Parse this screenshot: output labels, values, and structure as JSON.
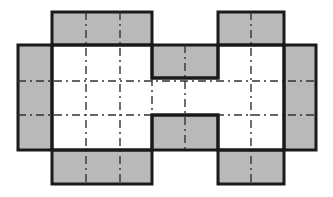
{
  "diagram": {
    "type": "box-net",
    "canvas": {
      "width": 333,
      "height": 197
    },
    "colors": {
      "fill": "#b9b9b9",
      "stroke": "#1a1a1a",
      "fold": "#333333",
      "background": "#ffffff"
    },
    "gray_panels": [
      {
        "name": "left-flap",
        "x": 18,
        "y": 45,
        "w": 34,
        "h": 105
      },
      {
        "name": "top-left-tab",
        "x": 52,
        "y": 12,
        "w": 100,
        "h": 33
      },
      {
        "name": "bottom-left-tab",
        "x": 52,
        "y": 150,
        "w": 100,
        "h": 34
      },
      {
        "name": "middle-top-tab",
        "x": 152,
        "y": 45,
        "w": 66,
        "h": 33
      },
      {
        "name": "middle-bottom-tab",
        "x": 152,
        "y": 115,
        "w": 66,
        "h": 35
      },
      {
        "name": "top-right-tab",
        "x": 218,
        "y": 12,
        "w": 66,
        "h": 33
      },
      {
        "name": "bottom-right-tab",
        "x": 218,
        "y": 150,
        "w": 66,
        "h": 34
      },
      {
        "name": "right-flap",
        "x": 284,
        "y": 45,
        "w": 32,
        "h": 105
      }
    ],
    "fold_lines": [
      {
        "name": "fold-v-1",
        "x1": 86,
        "y1": 12,
        "x2": 86,
        "y2": 184
      },
      {
        "name": "fold-v-2",
        "x1": 120,
        "y1": 12,
        "x2": 120,
        "y2": 184
      },
      {
        "name": "fold-v-3",
        "x1": 152,
        "y1": 78,
        "x2": 152,
        "y2": 115
      },
      {
        "name": "fold-v-4",
        "x1": 185,
        "y1": 45,
        "x2": 185,
        "y2": 150
      },
      {
        "name": "fold-v-5",
        "x1": 251,
        "y1": 12,
        "x2": 251,
        "y2": 184
      },
      {
        "name": "fold-h-1",
        "x1": 18,
        "y1": 81,
        "x2": 316,
        "y2": 81
      },
      {
        "name": "fold-h-2",
        "x1": 18,
        "y1": 115,
        "x2": 316,
        "y2": 115
      }
    ]
  }
}
